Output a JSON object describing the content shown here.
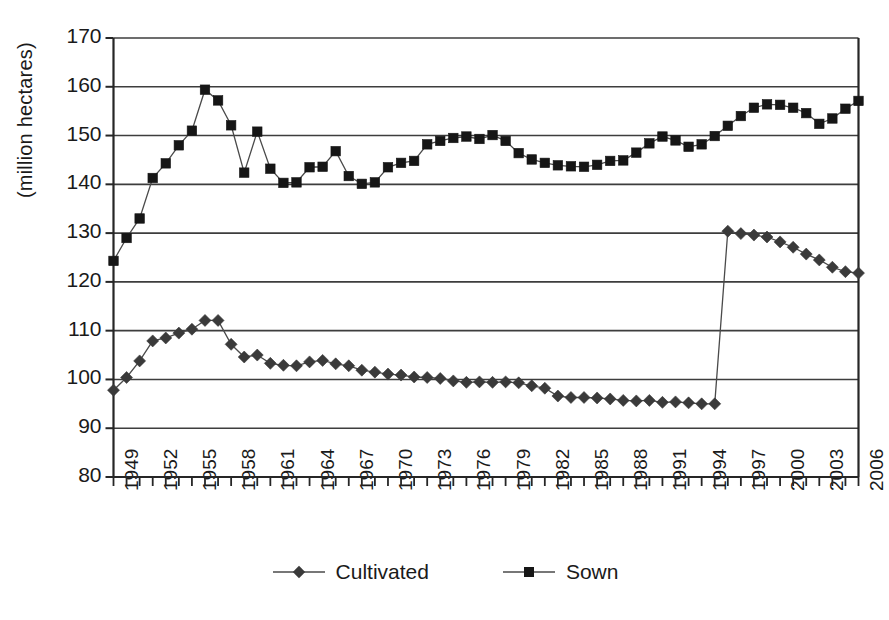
{
  "chart_data": {
    "type": "line",
    "title": "",
    "xlabel": "",
    "ylabel": "(million hectares)",
    "ylim": [
      80,
      170
    ],
    "ytick_labels": [
      "170",
      "160",
      "150",
      "140",
      "130",
      "120",
      "110",
      "100",
      "90",
      "80"
    ],
    "yticks": [
      170,
      160,
      150,
      140,
      130,
      120,
      110,
      100,
      90,
      80
    ],
    "grid": "horizontal",
    "legend_position": "bottom-center",
    "xlim": [
      1949,
      2006
    ],
    "x": [
      1949,
      1950,
      1951,
      1952,
      1953,
      1954,
      1955,
      1956,
      1957,
      1958,
      1959,
      1960,
      1961,
      1962,
      1963,
      1964,
      1965,
      1966,
      1967,
      1968,
      1969,
      1970,
      1971,
      1972,
      1973,
      1974,
      1975,
      1976,
      1977,
      1978,
      1979,
      1980,
      1981,
      1982,
      1983,
      1984,
      1985,
      1986,
      1987,
      1988,
      1989,
      1990,
      1991,
      1992,
      1993,
      1994,
      1995,
      1996,
      1997,
      1998,
      1999,
      2000,
      2001,
      2002,
      2003,
      2004,
      2005,
      2006
    ],
    "xtick_labels": [
      "1949",
      "1950",
      "1951",
      "1952",
      "1953",
      "1954",
      "1955",
      "1956",
      "1957",
      "1958",
      "1959",
      "1960",
      "1961",
      "1962",
      "1963",
      "1964",
      "1965",
      "1966",
      "1967",
      "1968",
      "1969",
      "1970",
      "1971",
      "1972",
      "1973",
      "1974",
      "1975",
      "1976",
      "1977",
      "1978",
      "1979",
      "1980",
      "1981",
      "1982",
      "1983",
      "1984",
      "1985",
      "1986",
      "1987",
      "1988",
      "1989",
      "1990",
      "1991",
      "1992",
      "1993",
      "1994",
      "1995",
      "1996",
      "1997",
      "1998",
      "1999",
      "2000",
      "2001",
      "2002",
      "2003",
      "2004",
      "2005",
      "2006"
    ],
    "xtick_labels_shown": [
      "1949",
      "1952",
      "1955",
      "1958",
      "1961",
      "1964",
      "1967",
      "1970",
      "1973",
      "1976",
      "1979",
      "1982",
      "1985",
      "1988",
      "1991",
      "1994",
      "1997",
      "2000",
      "2003",
      "2006"
    ],
    "series": [
      {
        "name": "Cultivated",
        "marker": "diamond",
        "color": "#3a3a3a",
        "values": [
          97.8,
          100.4,
          103.8,
          107.9,
          108.5,
          109.5,
          110.3,
          112.1,
          112.1,
          107.2,
          104.6,
          105.0,
          103.3,
          102.9,
          102.8,
          103.6,
          103.9,
          103.2,
          102.8,
          101.9,
          101.5,
          101.1,
          100.9,
          100.5,
          100.4,
          100.2,
          99.7,
          99.4,
          99.5,
          99.4,
          99.5,
          99.3,
          98.7,
          98.2,
          96.6,
          96.3,
          96.3,
          96.2,
          96.0,
          95.7,
          95.6,
          95.7,
          95.3,
          95.4,
          95.2,
          95.0,
          95.0,
          130.4,
          129.9,
          129.6,
          129.2,
          128.2,
          127.1,
          125.7,
          124.5,
          123.0,
          122.1,
          121.8
        ]
      },
      {
        "name": "Sown",
        "marker": "square",
        "color": "#161616",
        "values": [
          124.3,
          129.0,
          133.0,
          141.3,
          144.3,
          148.0,
          151.0,
          159.4,
          157.2,
          152.1,
          142.4,
          150.8,
          143.2,
          140.3,
          140.4,
          143.5,
          143.6,
          146.8,
          141.7,
          140.1,
          140.4,
          143.5,
          144.4,
          144.8,
          148.2,
          148.9,
          149.5,
          149.8,
          149.3,
          150.1,
          148.9,
          146.4,
          145.1,
          144.4,
          143.9,
          143.7,
          143.6,
          144.0,
          144.8,
          144.9,
          146.5,
          148.4,
          149.8,
          149.0,
          147.7,
          148.2,
          149.9,
          152.0,
          154.0,
          155.7,
          156.4,
          156.3,
          155.7,
          154.6,
          152.4,
          153.5,
          155.5,
          157.1
        ]
      }
    ]
  },
  "legend": {
    "items": [
      {
        "label": "Cultivated",
        "marker": "diamond-marker"
      },
      {
        "label": "Sown",
        "marker": "square-marker"
      }
    ]
  },
  "axes": {
    "y_axis_title": "(million hectares)"
  }
}
